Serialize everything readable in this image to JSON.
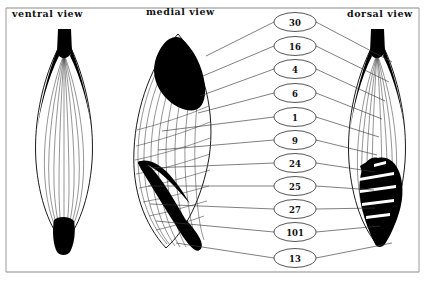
{
  "figure": {
    "width": 425,
    "height": 283,
    "background_color": "#ffffff",
    "ink_color": "#000000",
    "frame_color": "#8a8a8a"
  },
  "panels": [
    {
      "id": "ventral",
      "title": "ventral view",
      "title_x": 12,
      "title_y": 17
    },
    {
      "id": "medial",
      "title": "medial view",
      "title_x": 146,
      "title_y": 15
    },
    {
      "id": "dorsal",
      "title": "dorsal view",
      "title_x": 347,
      "title_y": 17
    }
  ],
  "nodes": [
    {
      "label": "30",
      "cx": 295,
      "cy": 22,
      "rx": 21,
      "ry": 9.5
    },
    {
      "label": "16",
      "cx": 295,
      "cy": 46,
      "rx": 21,
      "ry": 9.5
    },
    {
      "label": "4",
      "cx": 295,
      "cy": 69,
      "rx": 21,
      "ry": 9.5
    },
    {
      "label": "6",
      "cx": 295,
      "cy": 93,
      "rx": 21,
      "ry": 9.5
    },
    {
      "label": "1",
      "cx": 295,
      "cy": 117,
      "rx": 21,
      "ry": 9.5
    },
    {
      "label": "9",
      "cx": 295,
      "cy": 140,
      "rx": 21,
      "ry": 9.5
    },
    {
      "label": "24",
      "cx": 295,
      "cy": 163,
      "rx": 21,
      "ry": 9.5
    },
    {
      "label": "25",
      "cx": 295,
      "cy": 186,
      "rx": 21,
      "ry": 9.5
    },
    {
      "label": "27",
      "cx": 295,
      "cy": 209,
      "rx": 21,
      "ry": 9.5
    },
    {
      "label": "101",
      "cx": 295,
      "cy": 232,
      "rx": 21,
      "ry": 9.5
    },
    {
      "label": "13",
      "cx": 295,
      "cy": 258,
      "rx": 21,
      "ry": 9.5
    }
  ],
  "connectors_left": [
    {
      "node": "30",
      "x1": 274,
      "y1": 22,
      "x2": 206,
      "y2": 56
    },
    {
      "node": "16",
      "x1": 274,
      "y1": 46,
      "x2": 203,
      "y2": 76
    },
    {
      "node": "4",
      "x1": 274,
      "y1": 69,
      "x2": 200,
      "y2": 96
    },
    {
      "node": "6",
      "x1": 274,
      "y1": 93,
      "x2": 198,
      "y2": 113
    },
    {
      "node": "1",
      "x1": 274,
      "y1": 117,
      "x2": 162,
      "y2": 131
    },
    {
      "node": "9",
      "x1": 274,
      "y1": 140,
      "x2": 158,
      "y2": 150
    },
    {
      "node": "24",
      "x1": 274,
      "y1": 163,
      "x2": 152,
      "y2": 168
    },
    {
      "node": "25",
      "x1": 274,
      "y1": 186,
      "x2": 148,
      "y2": 186
    },
    {
      "node": "27",
      "x1": 274,
      "y1": 209,
      "x2": 150,
      "y2": 204
    },
    {
      "node": "101",
      "x1": 274,
      "y1": 232,
      "x2": 156,
      "y2": 221
    },
    {
      "node": "13",
      "x1": 274,
      "y1": 258,
      "x2": 176,
      "y2": 243
    }
  ],
  "connectors_right": [
    {
      "node": "30",
      "x1": 316,
      "y1": 22,
      "x2": 392,
      "y2": 62
    },
    {
      "node": "16",
      "x1": 316,
      "y1": 46,
      "x2": 389,
      "y2": 82
    },
    {
      "node": "4",
      "x1": 316,
      "y1": 69,
      "x2": 385,
      "y2": 101
    },
    {
      "node": "6",
      "x1": 316,
      "y1": 93,
      "x2": 382,
      "y2": 119
    },
    {
      "node": "1",
      "x1": 316,
      "y1": 117,
      "x2": 379,
      "y2": 137
    },
    {
      "node": "9",
      "x1": 316,
      "y1": 140,
      "x2": 377,
      "y2": 155
    },
    {
      "node": "24",
      "x1": 316,
      "y1": 163,
      "x2": 375,
      "y2": 172
    },
    {
      "node": "25",
      "x1": 316,
      "y1": 186,
      "x2": 374,
      "y2": 190
    },
    {
      "node": "27",
      "x1": 316,
      "y1": 209,
      "x2": 375,
      "y2": 208
    },
    {
      "node": "101",
      "x1": 316,
      "y1": 232,
      "x2": 380,
      "y2": 226
    },
    {
      "node": "13",
      "x1": 316,
      "y1": 258,
      "x2": 392,
      "y2": 243
    }
  ],
  "frame": {
    "top_y": 8,
    "bottom_y": 272,
    "left_x": 6,
    "right_x": 419
  }
}
